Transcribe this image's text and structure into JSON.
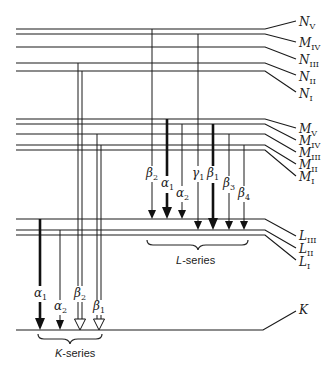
{
  "diagram": {
    "levels": {
      "N": [
        {
          "shell": "N",
          "sub": "V",
          "y": 29
        },
        {
          "shell": "M",
          "sub": "IV",
          "y": 34
        },
        {
          "shell": "N",
          "sub": "III",
          "y": 47
        },
        {
          "shell": "N",
          "sub": "II",
          "y": 63
        },
        {
          "shell": "N",
          "sub": "I",
          "y": 71
        }
      ],
      "M": [
        {
          "shell": "M",
          "sub": "V",
          "y": 119
        },
        {
          "shell": "M",
          "sub": "IV",
          "y": 124
        },
        {
          "shell": "M",
          "sub": "III",
          "y": 134
        },
        {
          "shell": "M",
          "sub": "II",
          "y": 145
        },
        {
          "shell": "M",
          "sub": "I",
          "y": 150
        }
      ],
      "L": [
        {
          "shell": "L",
          "sub": "III",
          "y": 219
        },
        {
          "shell": "L",
          "sub": "II",
          "y": 230
        },
        {
          "shell": "L",
          "sub": "I",
          "y": 235
        }
      ],
      "K": [
        {
          "shell": "K",
          "sub": "",
          "y": 330
        }
      ]
    },
    "k_series": {
      "label": "K-series",
      "transitions": [
        {
          "greek": "α",
          "sub": "1",
          "style": "thick"
        },
        {
          "greek": "α",
          "sub": "2",
          "style": "thin"
        },
        {
          "greek": "β",
          "sub": "2",
          "style": "double"
        },
        {
          "greek": "β",
          "sub": "1",
          "style": "double"
        }
      ]
    },
    "l_series": {
      "label": "L-series",
      "transitions": [
        {
          "greek": "β",
          "sub": "2",
          "style": "thin"
        },
        {
          "greek": "α",
          "sub": "1",
          "style": "thick"
        },
        {
          "greek": "α",
          "sub": "2",
          "style": "thin"
        },
        {
          "greek": "γ",
          "sub": "1",
          "style": "thin"
        },
        {
          "greek": "β",
          "sub": "1",
          "style": "thick"
        },
        {
          "greek": "β",
          "sub": "3",
          "style": "thin"
        },
        {
          "greek": "β",
          "sub": "4",
          "style": "thin"
        }
      ]
    }
  }
}
